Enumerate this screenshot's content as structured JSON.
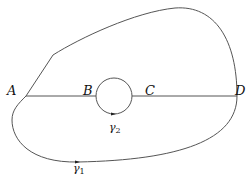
{
  "diagram": {
    "points": {
      "A": {
        "label": "A",
        "x": 26,
        "y": 96
      },
      "B": {
        "label": "B",
        "x": 96,
        "y": 96
      },
      "C": {
        "label": "C",
        "x": 132,
        "y": 96
      },
      "D": {
        "label": "D",
        "x": 237,
        "y": 96
      }
    },
    "curves": {
      "gamma1": {
        "label": "γ",
        "subscript": "1"
      },
      "gamma2": {
        "label": "γ",
        "subscript": "2"
      }
    },
    "stroke_color": "#555555",
    "label_color": "#111111"
  }
}
